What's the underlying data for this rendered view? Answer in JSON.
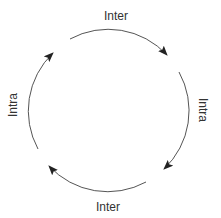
{
  "diagram": {
    "type": "cycle",
    "stroke_color": "#555555",
    "labels": {
      "top": "Inter",
      "right": "Intra",
      "bottom": "Inter",
      "left": "Intra"
    },
    "arcs": [
      {
        "position": "top",
        "label": "Inter",
        "direction": "clockwise"
      },
      {
        "position": "right",
        "label": "Intra",
        "direction": "clockwise"
      },
      {
        "position": "bottom",
        "label": "Inter",
        "direction": "clockwise"
      },
      {
        "position": "left",
        "label": "Intra",
        "direction": "clockwise"
      }
    ]
  }
}
